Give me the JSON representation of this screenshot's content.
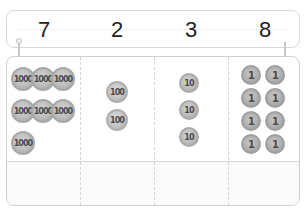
{
  "place_value_chart": {
    "columns": [
      {
        "digit": "7",
        "coin_label": "1000",
        "coin_count": 7
      },
      {
        "digit": "2",
        "coin_label": "100",
        "coin_count": 2
      },
      {
        "digit": "3",
        "coin_label": "10",
        "coin_count": 3
      },
      {
        "digit": "8",
        "coin_label": "1",
        "coin_count": 8
      }
    ]
  },
  "colors": {
    "border": "#d0d0d0",
    "coin": "#bdbdbd",
    "text": "#222222"
  }
}
